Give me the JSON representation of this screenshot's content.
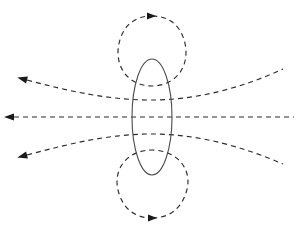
{
  "figure": {
    "background_color": "#ffffff",
    "width": 298,
    "height": 234
  },
  "style": {
    "field_line_color": "#2b2b2b",
    "loop_color": "#4a4a4a",
    "arrow_color": "#1a1a1a",
    "dash_pattern": "5 4",
    "stroke_width": 1.15
  },
  "chart_data": {
    "type": "scatter",
    "xlabel": "",
    "ylabel": "",
    "grid": false,
    "legend": null,
    "xlim": [
      0,
      298
    ],
    "ylim": [
      0,
      234
    ],
    "current_loop": {
      "name": "current-loop-ellipse",
      "shape": "ellipse",
      "center_x": 152,
      "center_y": 117,
      "radius_x": 20,
      "radius_y": 58,
      "line_style": "solid",
      "color": "#4a4a4a"
    },
    "series": [
      {
        "name": "upper-closed-field-loop",
        "style": "dashed",
        "closed": true,
        "path": "M 152 16 C 182 16 186 44 186 52 C 186 74 170 86 152 86 C 134 86 118 74 118 52 C 118 44 122 16 152 16 Z",
        "arrow": {
          "x": 147,
          "y": 16,
          "direction": "right",
          "angle": 0
        }
      },
      {
        "name": "lower-closed-field-loop",
        "style": "dashed",
        "closed": true,
        "path": "M 152 218 C 182 218 188 190 188 182 C 188 162 171 150 152 150 C 133 150 117 162 117 182 C 117 190 122 218 152 218 Z",
        "arrow": {
          "x": 148,
          "y": 218,
          "direction": "right",
          "angle": 0
        }
      },
      {
        "name": "upper-outward-field-line",
        "style": "dashed",
        "open": true,
        "path": "M 27 80 C 72 92 110 100 152 100 C 200 100 246 86 283 69",
        "arrow": {
          "x": 27,
          "y": 80,
          "direction": "left-up",
          "angle": 195
        }
      },
      {
        "name": "equatorial-field-line",
        "style": "dashed",
        "open": true,
        "path": "M 14 117 L 294 117",
        "arrow": {
          "x": 14,
          "y": 117,
          "direction": "left",
          "angle": 180
        }
      },
      {
        "name": "lower-outward-field-line",
        "style": "dashed",
        "open": true,
        "path": "M 27 155 C 72 143 110 134 152 134 C 200 134 246 148 283 164",
        "arrow": {
          "x": 27,
          "y": 155,
          "direction": "left-down",
          "angle": 165
        }
      }
    ],
    "arrow_count": 5,
    "arrowheads": [
      {
        "label": "upper-loop-arrow",
        "x": 147,
        "y": 16,
        "points": "right"
      },
      {
        "label": "lower-loop-arrow",
        "x": 148,
        "y": 218,
        "points": "right"
      },
      {
        "label": "upper-left-arrow",
        "x": 27,
        "y": 80,
        "points": "left-up"
      },
      {
        "label": "middle-left-arrow",
        "x": 14,
        "y": 117,
        "points": "left"
      },
      {
        "label": "lower-left-arrow",
        "x": 27,
        "y": 155,
        "points": "left-down"
      }
    ]
  }
}
